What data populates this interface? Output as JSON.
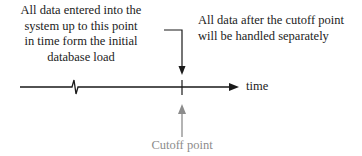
{
  "diagram": {
    "left_note": "All data entered into the system up to this point in time form the initial database load",
    "left_note_lines": [
      "All data entered into the",
      "system up to this point",
      "in time form the initial",
      "database load"
    ],
    "right_note_lines": [
      "All data after the cutoff point",
      "will be handled separately"
    ],
    "axis_label": "time",
    "cutoff_label": "Cutoff point",
    "colors": {
      "line": "#1a1a1a",
      "cutoff": "#8c8c8c",
      "background": "#ffffff"
    }
  }
}
